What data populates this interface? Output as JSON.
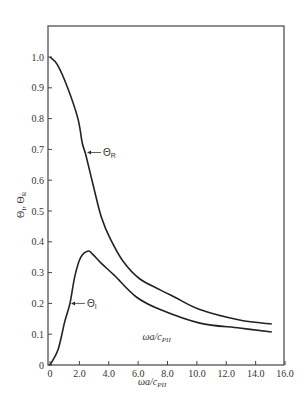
{
  "chart_data": {
    "type": "line",
    "title": "",
    "xlabel": "ωa/c_PII",
    "ylabel": "Θ_I, Θ_R",
    "xlim": [
      0,
      16.0
    ],
    "ylim": [
      0,
      1.1
    ],
    "grid": false,
    "legend": "inline curve labels with arrows",
    "x_ticks": [
      "0",
      "2.0",
      "4.0",
      "6.0",
      "8.0",
      "10.0",
      "12.0",
      "14.0",
      "16.0"
    ],
    "y_ticks": [
      "0",
      "0.1",
      "0.2",
      "0.3",
      "0.4",
      "0.5",
      "0.6",
      "0.7",
      "0.8",
      "0.9",
      "1.0"
    ],
    "series": [
      {
        "name": "Θ_R",
        "label_main": "Θ",
        "label_sub": "R",
        "label_anchor": {
          "x": 2.45,
          "y": 0.69
        },
        "x": [
          0,
          0.5,
          1.2,
          1.9,
          2.2,
          2.45,
          3.06,
          3.5,
          4.1,
          5.0,
          6.1,
          7.5,
          8.5,
          10.2,
          12.9,
          15.1
        ],
        "y": [
          1.0,
          0.975,
          0.9,
          0.8,
          0.72,
          0.68,
          0.56,
          0.48,
          0.41,
          0.335,
          0.28,
          0.244,
          0.22,
          0.18,
          0.146,
          0.133
        ]
      },
      {
        "name": "Θ_I",
        "label_main": "Θ",
        "label_sub": "I",
        "label_anchor": {
          "x": 1.36,
          "y": 0.2
        },
        "x": [
          0,
          0.55,
          1.0,
          1.36,
          1.7,
          2.1,
          2.6,
          2.9,
          3.5,
          4.4,
          5.9,
          7.5,
          10.2,
          12.9,
          15.1
        ],
        "y": [
          0,
          0.05,
          0.14,
          0.2,
          0.29,
          0.35,
          0.37,
          0.36,
          0.33,
          0.29,
          0.22,
          0.18,
          0.136,
          0.12,
          0.107
        ]
      }
    ],
    "annotations": [
      {
        "text_main": "ωa/c",
        "text_sub": "PII",
        "x": 6.3,
        "y": 0.08
      }
    ]
  },
  "axes": {
    "x_title_main": "ωa/c",
    "x_title_sub": "PII",
    "y_title": "Θ",
    "y_title_sub_i": "I",
    "y_title_sep": ", Θ",
    "y_title_sub_r": "R"
  },
  "colors": {
    "curve": "#222222",
    "frame": "#444444",
    "text": "#333333"
  }
}
